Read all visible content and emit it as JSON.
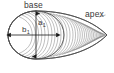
{
  "figure": {
    "type": "morphology-diagram",
    "labels": {
      "base": "base",
      "apex": "apex",
      "minor_axis": "b",
      "minor_axis_subscript": "1",
      "major_axis": "a",
      "major_axis_subscript": "1"
    },
    "colors": {
      "outline": "#3c3c3c",
      "arrow": "#1a1a1a",
      "hatch": "#8c8c8c",
      "text": "#3a3a3a",
      "background": "#ffffff"
    },
    "geometry": {
      "ellipse_center_x": 36,
      "ellipse_center_y": 35,
      "ellipse_rx": 28,
      "ellipse_ry": 24,
      "apex_x": 108,
      "apex_y": 36,
      "vertical_arrow_top_y": 11,
      "vertical_arrow_bottom_y": 59,
      "horizontal_arrow_left_x": 9,
      "horizontal_arrow_right_x": 58,
      "contour_count": 34
    }
  }
}
